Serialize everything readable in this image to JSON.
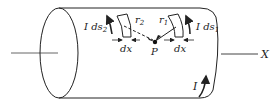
{
  "figure": {
    "labels": {
      "current_element_left": "I ds",
      "current_element_left_sub": "2",
      "current_element_right": "I ds",
      "current_element_right_sub": "1",
      "r_left": "r",
      "r_left_sub": "2",
      "r_right": "r",
      "r_right_sub": "1",
      "dx_left": "dx",
      "dx_right": "dx",
      "point": "P",
      "current": "I",
      "axis": "X"
    },
    "colors": {
      "stroke": "#222222",
      "axis_line": "#555555",
      "background": "#ffffff"
    }
  }
}
